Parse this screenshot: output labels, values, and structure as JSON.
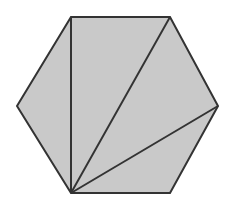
{
  "figure": {
    "kind": "geometry-diagram",
    "shape_name": "hexagon",
    "background_color": "#ffffff",
    "fill_color": "#c9c9c9",
    "stroke_color": "#333333",
    "stroke_width": 2,
    "interior_stroke_width": 2,
    "canvas": {
      "width": 231,
      "height": 208
    },
    "outline": {
      "name": "hexagon-outline",
      "points": "71,17 170,17 218,106 170,193 71,193 17,106"
    },
    "vertices": [
      {
        "name": "vertex-top-left",
        "x": 71,
        "y": 17
      },
      {
        "name": "vertex-top-right",
        "x": 170,
        "y": 17
      },
      {
        "name": "vertex-right",
        "x": 218,
        "y": 106
      },
      {
        "name": "vertex-bottom-right",
        "x": 170,
        "y": 193
      },
      {
        "name": "vertex-bottom-left",
        "x": 71,
        "y": 193
      },
      {
        "name": "vertex-left",
        "x": 17,
        "y": 106
      }
    ],
    "diagonals": [
      {
        "name": "diagonal-bottom-left-to-top-left",
        "x1": 71,
        "y1": 193,
        "x2": 71,
        "y2": 17
      },
      {
        "name": "diagonal-bottom-left-to-top-right",
        "x1": 71,
        "y1": 193,
        "x2": 170,
        "y2": 17
      },
      {
        "name": "diagonal-bottom-left-to-right",
        "x1": 71,
        "y1": 193,
        "x2": 218,
        "y2": 106
      }
    ],
    "labels": []
  }
}
